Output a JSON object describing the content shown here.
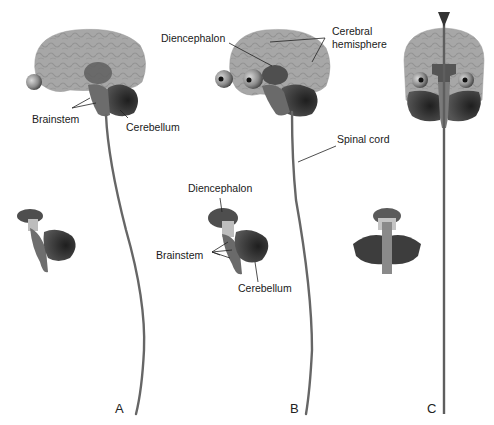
{
  "figure": {
    "panels": [
      {
        "id": "A",
        "label": "A",
        "view": "lateral",
        "annotations": [
          "Brainstem",
          "Cerebellum"
        ]
      },
      {
        "id": "B",
        "label": "B",
        "view": "lateral",
        "annotations": [
          "Diencephalon",
          "Cerebral hemisphere",
          "Spinal cord"
        ]
      },
      {
        "id": "C",
        "label": "C",
        "view": "anterior",
        "annotations": []
      }
    ],
    "inset_labels": {
      "diencephalon": "Diencephalon",
      "brainstem": "Brainstem",
      "cerebellum": "Cerebellum"
    },
    "colors": {
      "cerebrum": "#a9a9a9",
      "cerebrum_fold": "#949494",
      "diencephalon": "#5e5e5e",
      "brainstem": "#6f6f6f",
      "cerebellum": "#3a3a3a",
      "spinal_cord": "#6a6a6a",
      "eye": "#8a8a8a",
      "leader_line": "#222222"
    }
  },
  "labels": {
    "a_brainstem": "Brainstem",
    "a_cerebellum": "Cerebellum",
    "b_diencephalon": "Diencephalon",
    "b_cerebral_hemisphere_1": "Cerebral",
    "b_cerebral_hemisphere_2": "hemisphere",
    "b_spinal_cord": "Spinal cord",
    "b_inset_diencephalon": "Diencephalon",
    "b_inset_brainstem": "Brainstem",
    "b_inset_cerebellum": "Cerebellum",
    "panel_a": "A",
    "panel_b": "B",
    "panel_c": "C"
  }
}
